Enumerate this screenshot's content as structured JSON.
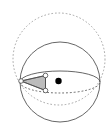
{
  "figure": {
    "width": 110,
    "height": 127,
    "background_color": "#ffffff"
  },
  "colors": {
    "outline": "#555555",
    "dashed_outline": "#9a9a9a",
    "triangle_fill": "#b0b0b0",
    "triangle_stroke": "#4a4a4a",
    "vertex_fill": "#ffffff",
    "vertex_stroke": "#4a4a4a",
    "point_fill": "#000000"
  },
  "shapes": {
    "outer_dashed_circle": {
      "name": "outer-dashed-circle",
      "cx": 59,
      "cy": 59,
      "r": 46,
      "style": "dashed",
      "stroke": "#9a9a9a",
      "stroke_width": 0.9,
      "dash_pattern": "1.6 2.0"
    },
    "sphere_circle": {
      "name": "sphere-outline-circle",
      "cx": 60,
      "cy": 82,
      "r": 40,
      "style": "solid",
      "stroke": "#555555",
      "stroke_width": 0.9
    },
    "equator_ellipse": {
      "name": "equator-ellipse",
      "cx": 60,
      "cy": 82,
      "rx": 40,
      "ry": 11,
      "back_arc_style": "solid",
      "front_arc_style": "dashed",
      "stroke": "#555555",
      "stroke_width": 0.9,
      "dash_pattern": "1.8 2.0"
    },
    "triangle": {
      "name": "spherical-triangle",
      "fill": "#b0b0b0",
      "fill_opacity": 0.85,
      "stroke": "#4a4a4a",
      "stroke_width": 0.8,
      "vertices": [
        {
          "label": "vertex-left",
          "x": 21,
          "y": 81
        },
        {
          "label": "vertex-top",
          "x": 45.5,
          "y": 75.5
        },
        {
          "label": "vertex-bottom",
          "x": 45.5,
          "y": 90.5
        }
      ],
      "vertex_marker_radius": 2.3
    },
    "interior_point": {
      "name": "interior-point",
      "cx": 58.5,
      "cy": 81,
      "r": 3.2,
      "fill": "#000000"
    },
    "chord_lines": [
      {
        "name": "chord-left-to-top",
        "x1": 21,
        "y1": 81,
        "x2": 45.5,
        "y2": 75.5
      },
      {
        "name": "chord-left-to-bottom",
        "x1": 21,
        "y1": 81,
        "x2": 45.5,
        "y2": 90.5
      },
      {
        "name": "chord-top-to-bottom",
        "x1": 45.5,
        "y1": 75.5,
        "x2": 45.5,
        "y2": 90.5
      }
    ]
  }
}
